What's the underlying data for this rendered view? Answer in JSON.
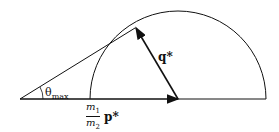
{
  "diagram": {
    "labels": {
      "theta": "θ",
      "theta_sub": "max",
      "q": "q*",
      "m1": "m",
      "m1_sub": "1",
      "m2": "m",
      "m2_sub": "2",
      "p": "p*"
    },
    "colors": {
      "stroke": "#111111",
      "background": "#ffffff"
    }
  }
}
